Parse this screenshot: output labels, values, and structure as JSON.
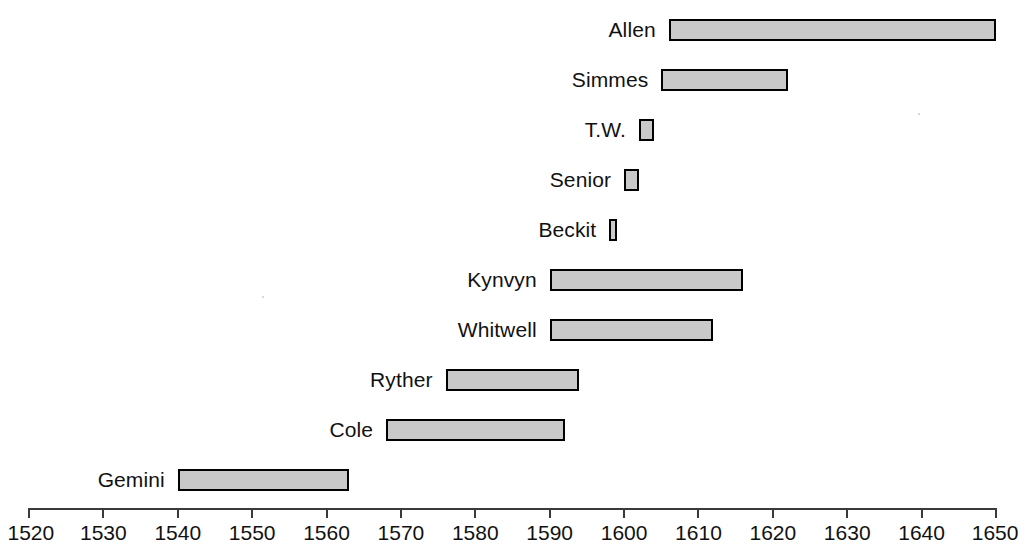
{
  "chart_data": {
    "type": "bar",
    "orientation": "horizontal-range",
    "title": "",
    "subtitle": "",
    "xlabel": "",
    "ylabel": "",
    "xlim": [
      1520,
      1650
    ],
    "grid": false,
    "legend": null,
    "x_ticks": [
      1520,
      1530,
      1540,
      1550,
      1560,
      1570,
      1580,
      1590,
      1600,
      1610,
      1620,
      1630,
      1640,
      1650
    ],
    "x_tick_labels": [
      "1520",
      "1530",
      "1540",
      "1550",
      "1560",
      "1570",
      "1580",
      "1590",
      "1600",
      "1610",
      "1620",
      "1630",
      "1640",
      "1650"
    ],
    "categories": [
      "Allen",
      "Simmes",
      "T.W.",
      "Senior",
      "Beckit",
      "Kynvyn",
      "Whitwell",
      "Ryther",
      "Cole",
      "Gemini"
    ],
    "bars": [
      {
        "label": "Allen",
        "start": 1606,
        "end": 1650
      },
      {
        "label": "Simmes",
        "start": 1605,
        "end": 1622
      },
      {
        "label": "T.W.",
        "start": 1602,
        "end": 1604
      },
      {
        "label": "Senior",
        "start": 1600,
        "end": 1602
      },
      {
        "label": "Beckit",
        "start": 1598,
        "end": 1599
      },
      {
        "label": "Kynvyn",
        "start": 1590,
        "end": 1616
      },
      {
        "label": "Whitwell",
        "start": 1590,
        "end": 1612
      },
      {
        "label": "Ryther",
        "start": 1576,
        "end": 1594
      },
      {
        "label": "Cole",
        "start": 1568,
        "end": 1592
      },
      {
        "label": "Gemini",
        "start": 1540,
        "end": 1563
      }
    ],
    "bar_fill_color": "#c9c9c9",
    "bar_border_color": "#000000",
    "axis_color": "#3a3a3a",
    "text_color": "#111111",
    "background_color": "#ffffff"
  },
  "axis_geometry": {
    "x_start_px": 29,
    "x_end_px": 996,
    "row_height_px": 50,
    "first_row_top_px": 5,
    "bar_height_px": 22,
    "label_gap_px": 13
  }
}
